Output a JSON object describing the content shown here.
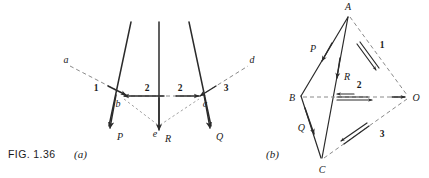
{
  "figure": {
    "caption_label": "FIG. 1.36",
    "panel_a_label": "(a)",
    "panel_b_label": "(b)"
  },
  "panel_a": {
    "name": "space-diagram",
    "ray_labels": [
      {
        "id": "a",
        "text": "a"
      },
      {
        "id": "d",
        "text": "d"
      },
      {
        "id": "e",
        "text": "e"
      }
    ],
    "node_labels": [
      {
        "id": "b",
        "text": "b"
      },
      {
        "id": "c",
        "text": "c"
      }
    ],
    "force_labels": [
      {
        "id": "P",
        "text": "P"
      },
      {
        "id": "R",
        "text": "R"
      },
      {
        "id": "Q",
        "text": "Q"
      }
    ],
    "segment_numbers": [
      {
        "id": "1",
        "text": "1"
      },
      {
        "id": "2-left",
        "text": "2"
      },
      {
        "id": "2-right",
        "text": "2"
      },
      {
        "id": "3",
        "text": "3"
      }
    ]
  },
  "panel_b": {
    "name": "force-polygon",
    "vertex_labels": [
      {
        "id": "A",
        "text": "A"
      },
      {
        "id": "B",
        "text": "B"
      },
      {
        "id": "C",
        "text": "C"
      },
      {
        "id": "O",
        "text": "O"
      }
    ],
    "force_labels": [
      {
        "id": "P",
        "text": "P"
      },
      {
        "id": "Q",
        "text": "Q"
      },
      {
        "id": "R",
        "text": "R"
      }
    ],
    "ray_numbers": [
      {
        "id": "1",
        "text": "1"
      },
      {
        "id": "2",
        "text": "2"
      },
      {
        "id": "3",
        "text": "3"
      }
    ]
  },
  "colors": {
    "ink": "#2b2b2b",
    "dashed": "#8a8a8a",
    "background": "#ffffff"
  }
}
